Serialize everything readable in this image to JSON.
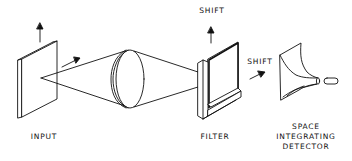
{
  "diagram": {
    "type": "optical-correlator-schematic",
    "components": [
      {
        "id": "input",
        "label": "INPUT"
      },
      {
        "id": "lens",
        "label": ""
      },
      {
        "id": "filter",
        "label": "FILTER"
      },
      {
        "id": "detector",
        "label_lines": [
          "SPACE",
          "INTEGRATING",
          "DETECTOR"
        ]
      }
    ],
    "annotations": {
      "filter_shift_up": "SHIFT",
      "filter_shift_right": "SHIFT"
    },
    "colors": {
      "stroke": "#111111",
      "background": "#ffffff"
    }
  }
}
